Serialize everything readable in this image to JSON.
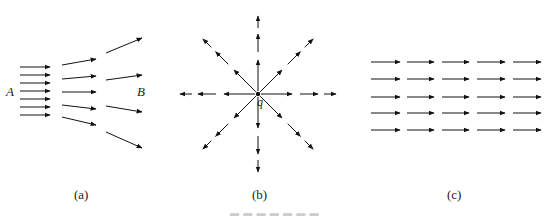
{
  "figure": {
    "panels": [
      {
        "id": "a",
        "caption": "(a)",
        "labels": {
          "left": "A",
          "right": "B"
        },
        "description": "Diverging field lines: dense parallel arrows at A spreading out toward B",
        "columns": [
          {
            "arrows": [
              {
                "x1": 20,
                "y1": 67,
                "x2": 50,
                "y2": 67
              },
              {
                "x1": 20,
                "y1": 75,
                "x2": 50,
                "y2": 75
              },
              {
                "x1": 20,
                "y1": 83,
                "x2": 50,
                "y2": 83
              },
              {
                "x1": 20,
                "y1": 91,
                "x2": 50,
                "y2": 91
              },
              {
                "x1": 20,
                "y1": 99,
                "x2": 50,
                "y2": 99
              },
              {
                "x1": 20,
                "y1": 107,
                "x2": 50,
                "y2": 107
              },
              {
                "x1": 20,
                "y1": 115,
                "x2": 50,
                "y2": 115
              }
            ]
          },
          {
            "arrows": [
              {
                "x1": 62,
                "y1": 65,
                "x2": 96,
                "y2": 59
              },
              {
                "x1": 62,
                "y1": 79,
                "x2": 96,
                "y2": 76
              },
              {
                "x1": 62,
                "y1": 92,
                "x2": 96,
                "y2": 92
              },
              {
                "x1": 62,
                "y1": 105,
                "x2": 96,
                "y2": 109
              },
              {
                "x1": 62,
                "y1": 117,
                "x2": 96,
                "y2": 125
              }
            ]
          },
          {
            "arrows": [
              {
                "x1": 106,
                "y1": 53,
                "x2": 142,
                "y2": 38
              },
              {
                "x1": 106,
                "y1": 80,
                "x2": 142,
                "y2": 75
              },
              {
                "x1": 106,
                "y1": 106,
                "x2": 142,
                "y2": 112
              },
              {
                "x1": 106,
                "y1": 132,
                "x2": 142,
                "y2": 148
              }
            ]
          }
        ]
      },
      {
        "id": "b",
        "caption": "(b)",
        "labels": {
          "charge": "q"
        },
        "description": "Radial field lines from point charge q",
        "center": {
          "x": 258,
          "y": 94
        },
        "directions_deg": [
          0,
          45,
          90,
          135,
          180,
          225,
          270,
          315
        ],
        "arrowhead_radii": [
          34,
          60,
          78
        ]
      },
      {
        "id": "c",
        "caption": "(c)",
        "labels": {},
        "description": "Uniform field: 5 rows x 5 columns of parallel arrows",
        "rows": [
          62,
          79,
          97,
          113,
          130
        ],
        "columns": [
          {
            "x1": 371,
            "x2": 400
          },
          {
            "x1": 407,
            "x2": 434
          },
          {
            "x1": 442,
            "x2": 469
          },
          {
            "x1": 477,
            "x2": 505
          },
          {
            "x1": 513,
            "x2": 541
          }
        ]
      }
    ],
    "figure_caption": "Figure (illegible)"
  },
  "labels": {
    "A": "A",
    "B": "B",
    "q": "q",
    "cap_a": "(a)",
    "cap_b": "(b)",
    "cap_c": "(c)"
  },
  "colors": {
    "ink": "#111111",
    "background": "#ffffff"
  }
}
